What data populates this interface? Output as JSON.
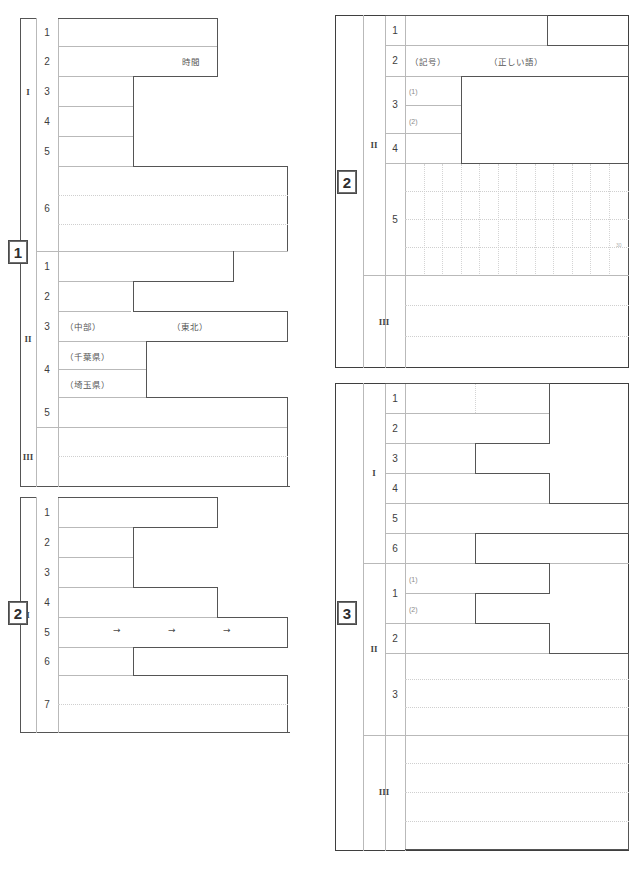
{
  "document": {
    "kind": "answer-sheet",
    "page_width": 643,
    "page_height": 877,
    "ink_color": "#3f3f3f",
    "rule_color": "#b9b9b9",
    "dotted_color": "#cfcfcf"
  },
  "blocks": [
    {
      "id": "block-1",
      "chip_label": "1",
      "sections": [
        {
          "roman": "I",
          "rows": [
            {
              "number": "1",
              "texts": []
            },
            {
              "number": "2",
              "texts": [
                "時間"
              ]
            },
            {
              "number": "3",
              "texts": []
            },
            {
              "number": "4",
              "texts": []
            },
            {
              "number": "5",
              "texts": []
            },
            {
              "number": "6",
              "texts": []
            }
          ]
        },
        {
          "roman": "II",
          "rows": [
            {
              "number": "1",
              "texts": []
            },
            {
              "number": "2",
              "texts": []
            },
            {
              "number": "3",
              "texts": [
                "（中部）",
                "（東北）"
              ]
            },
            {
              "number": "4",
              "texts": [
                "（千葉県）",
                "（埼玉県）"
              ]
            },
            {
              "number": "5",
              "texts": []
            }
          ]
        },
        {
          "roman": "III",
          "rows": []
        }
      ]
    },
    {
      "id": "block-2-left",
      "chip_label": "2",
      "sections": [
        {
          "roman": "I",
          "rows": [
            {
              "number": "1",
              "texts": []
            },
            {
              "number": "2",
              "texts": []
            },
            {
              "number": "3",
              "texts": []
            },
            {
              "number": "4",
              "texts": []
            },
            {
              "number": "5",
              "texts": [
                "→",
                "→",
                "→"
              ]
            },
            {
              "number": "6",
              "texts": []
            },
            {
              "number": "7",
              "texts": []
            }
          ]
        }
      ]
    },
    {
      "id": "block-2-right",
      "chip_label": "2",
      "sections": [
        {
          "roman": "II",
          "rows": [
            {
              "number": "1",
              "texts": []
            },
            {
              "number": "2",
              "texts": [
                "（記号）",
                "（正しい語）"
              ]
            },
            {
              "number": "3",
              "texts": [
                "(1)",
                "(2)"
              ]
            },
            {
              "number": "4",
              "texts": []
            },
            {
              "number": "5",
              "texts": [],
              "grid_marker": "30"
            }
          ]
        },
        {
          "roman": "III",
          "rows": []
        }
      ]
    },
    {
      "id": "block-3",
      "chip_label": "3",
      "sections": [
        {
          "roman": "I",
          "rows": [
            {
              "number": "1",
              "texts": []
            },
            {
              "number": "2",
              "texts": []
            },
            {
              "number": "3",
              "texts": []
            },
            {
              "number": "4",
              "texts": []
            },
            {
              "number": "5",
              "texts": []
            },
            {
              "number": "6",
              "texts": []
            }
          ]
        },
        {
          "roman": "II",
          "rows": [
            {
              "number": "1",
              "texts": [
                "(1)",
                "(2)"
              ]
            },
            {
              "number": "2",
              "texts": []
            },
            {
              "number": "3",
              "texts": []
            }
          ]
        },
        {
          "roman": "III",
          "rows": []
        }
      ]
    }
  ],
  "labels": {
    "b1_s1_r1": "1",
    "b1_s1_r2": "2",
    "b1_s1_r3": "3",
    "b1_s1_r4": "4",
    "b1_s1_r5": "5",
    "b1_s1_r6": "6",
    "b1_s2_r1": "1",
    "b1_s2_r2": "2",
    "b1_s2_r3": "3",
    "b1_s2_r4": "4",
    "b1_s2_r5": "5",
    "b1_roman_1": "I",
    "b1_roman_2": "II",
    "b1_roman_3": "III",
    "b1_chip": "1",
    "b1_time": "時間",
    "b1_chubu": "（中部）",
    "b1_tohoku": "（東北）",
    "b1_chiba": "（千葉県）",
    "b1_saitama": "（埼玉県）",
    "b2l_chip": "2",
    "b2l_roman": "I",
    "b2l_r1": "1",
    "b2l_r2": "2",
    "b2l_r3": "3",
    "b2l_r4": "4",
    "b2l_r5": "5",
    "b2l_r6": "6",
    "b2l_r7": "7",
    "b2l_arrow1": "→",
    "b2l_arrow2": "→",
    "b2l_arrow3": "→",
    "b2r_chip": "2",
    "b2r_roman_2": "II",
    "b2r_roman_3": "III",
    "b2r_r1": "1",
    "b2r_r2": "2",
    "b2r_r3": "3",
    "b2r_r4": "4",
    "b2r_r5": "5",
    "b2r_kigou": "（記号）",
    "b2r_tadashii": "（正しい語）",
    "b2r_sub1": "(1)",
    "b2r_sub2": "(2)",
    "b2r_grid_marker": "30",
    "b3_chip": "3",
    "b3_roman_1": "I",
    "b3_roman_2": "II",
    "b3_roman_3": "III",
    "b3_s1_r1": "1",
    "b3_s1_r2": "2",
    "b3_s1_r3": "3",
    "b3_s1_r4": "4",
    "b3_s1_r5": "5",
    "b3_s1_r6": "6",
    "b3_s2_r1": "1",
    "b3_s2_r2": "2",
    "b3_s2_r3": "3",
    "b3_sub1": "(1)",
    "b3_sub2": "(2)"
  }
}
